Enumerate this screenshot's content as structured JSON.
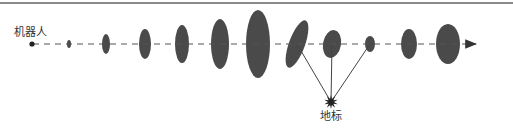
{
  "diagram": {
    "robot_label": "机器人",
    "landmark_label": "地标",
    "colors": {
      "ellipse_fill": "#4a4a4a",
      "line": "#555555",
      "rule": "#8a8a8a"
    },
    "robot": {
      "x": 32,
      "y": 44
    },
    "path": {
      "y": 44,
      "x_start": 33,
      "x_end": 476,
      "style": "dashed",
      "arrow": true
    },
    "poses": [
      {
        "cx": 69,
        "cy": 44,
        "rx": 2,
        "ry": 4,
        "rotate": 0
      },
      {
        "cx": 106,
        "cy": 44,
        "rx": 4,
        "ry": 10,
        "rotate": 0
      },
      {
        "cx": 145,
        "cy": 44,
        "rx": 6,
        "ry": 15,
        "rotate": 0
      },
      {
        "cx": 182,
        "cy": 44,
        "rx": 7,
        "ry": 19,
        "rotate": 0
      },
      {
        "cx": 220,
        "cy": 44,
        "rx": 9,
        "ry": 25,
        "rotate": 0
      },
      {
        "cx": 258,
        "cy": 44,
        "rx": 12,
        "ry": 34,
        "rotate": 0
      },
      {
        "cx": 297,
        "cy": 44,
        "rx": 8,
        "ry": 25,
        "rotate": 20
      },
      {
        "cx": 332,
        "cy": 44,
        "rx": 9,
        "ry": 14,
        "rotate": 10
      },
      {
        "cx": 370,
        "cy": 44,
        "rx": 5,
        "ry": 8,
        "rotate": 0
      },
      {
        "cx": 409,
        "cy": 44,
        "rx": 8,
        "ry": 15,
        "rotate": 0
      },
      {
        "cx": 448,
        "cy": 44,
        "rx": 12,
        "ry": 20,
        "rotate": 0
      }
    ],
    "landmark": {
      "x": 331,
      "y": 102
    },
    "observations_from_pose_indices": [
      6,
      7,
      8
    ]
  }
}
